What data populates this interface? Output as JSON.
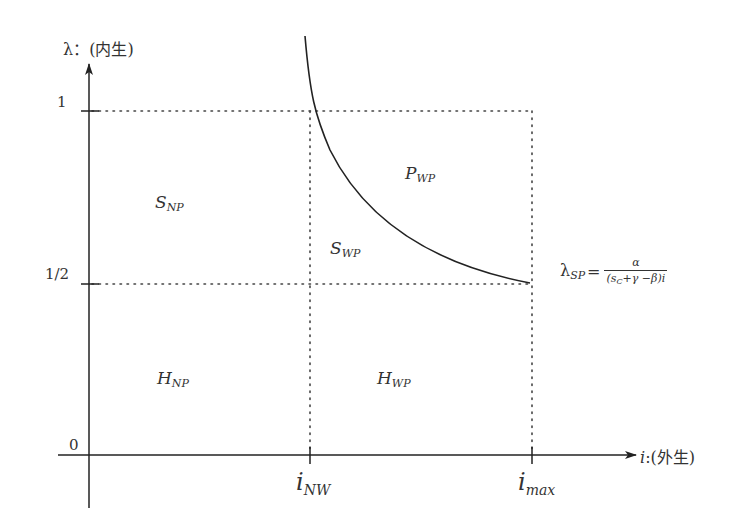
{
  "diagram": {
    "y_axis": {
      "symbol": "λ",
      "title": "：(内生)",
      "ticks": [
        {
          "label": "1",
          "value": 1
        },
        {
          "label": "1/2",
          "value": 0.5
        },
        {
          "label": "0",
          "value": 0
        }
      ]
    },
    "x_axis": {
      "symbol": "i",
      "title": ":(外生)",
      "ticks": [
        {
          "base": "i",
          "sub": "NW"
        },
        {
          "base": "i",
          "sub": "max"
        }
      ]
    },
    "regions": [
      {
        "id": "S_NP",
        "base": "S",
        "sub": "NP"
      },
      {
        "id": "P_WP",
        "base": "P",
        "sub": "WP"
      },
      {
        "id": "S_WP",
        "base": "S",
        "sub": "WP"
      },
      {
        "id": "H_NP",
        "base": "H",
        "sub": "NP"
      },
      {
        "id": "H_WP",
        "base": "H",
        "sub": "WP"
      }
    ],
    "curve": {
      "label_base": "λ",
      "label_sub": "SP",
      "equals": "=",
      "numerator": "α",
      "denominator": "(s",
      "denominator_sub": "C",
      "denominator_rest": "+γ −β)i"
    },
    "colors": {
      "axis": "#222222",
      "dotted": "#444444",
      "curve": "#222222",
      "text": "#333333"
    }
  }
}
